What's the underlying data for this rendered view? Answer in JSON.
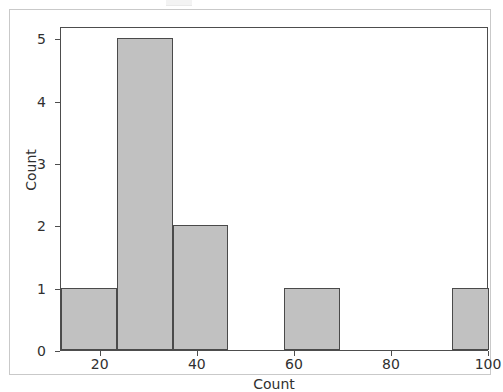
{
  "figure": {
    "background_color": "#ffffff",
    "frame_color": "#c9c9c9",
    "axes_color": "#4d4d4d"
  },
  "chart_data": {
    "type": "bar",
    "title": "",
    "subtitle": "",
    "xlabel": "Count",
    "ylabel": "Count",
    "xlim": [
      11.8,
      100.0
    ],
    "ylim": [
      0,
      5.2
    ],
    "grid": false,
    "legend": null,
    "bar_fill_color": "#c1c1c1",
    "bar_edge_color": "#4a4a4a",
    "x_ticks": [
      20,
      40,
      60,
      80,
      100
    ],
    "x_tick_labels": [
      "20",
      "40",
      "60",
      "80",
      "100"
    ],
    "y_ticks": [
      0,
      1,
      2,
      3,
      4,
      5
    ],
    "y_tick_labels": [
      "0",
      "1",
      "2",
      "3",
      "4",
      "5"
    ],
    "bin_edges": [
      11.8,
      23.3,
      34.8,
      46.3,
      57.8,
      69.3,
      80.8,
      92.3,
      100.0
    ],
    "categories": [
      "11.8-23.3",
      "23.3-34.8",
      "34.8-46.3",
      "46.3-57.8",
      "57.8-69.3",
      "69.3-80.8",
      "80.8-92.3",
      "92.3-100"
    ],
    "values": [
      1,
      5,
      2,
      0,
      1,
      0,
      0,
      1
    ],
    "bars": [
      {
        "label": "bin-1",
        "x0": 11.8,
        "x1": 23.3,
        "value": 1
      },
      {
        "label": "bin-2",
        "x0": 23.3,
        "x1": 34.8,
        "value": 5
      },
      {
        "label": "bin-3",
        "x0": 34.8,
        "x1": 46.3,
        "value": 2
      },
      {
        "label": "bin-4",
        "x0": 46.3,
        "x1": 57.8,
        "value": 0
      },
      {
        "label": "bin-5",
        "x0": 57.8,
        "x1": 69.3,
        "value": 1
      },
      {
        "label": "bin-6",
        "x0": 69.3,
        "x1": 80.8,
        "value": 0
      },
      {
        "label": "bin-7",
        "x0": 80.8,
        "x1": 92.3,
        "value": 0
      },
      {
        "label": "bin-8",
        "x0": 92.3,
        "x1": 100.0,
        "value": 1
      }
    ]
  }
}
